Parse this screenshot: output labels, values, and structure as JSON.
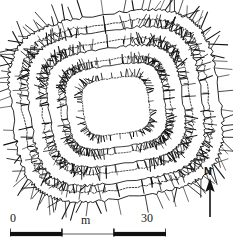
{
  "figure": {
    "kind": "archaeological-site-plan",
    "technique": "hachure",
    "ink_color": "#111111"
  },
  "scale_bar": {
    "name": "scale-bar",
    "start_label": "0",
    "unit_label": "m",
    "end_label": "30",
    "segments": [
      {
        "fill": "#101010",
        "from": 0,
        "to": 33.3
      },
      {
        "fill": "#9a9a9a",
        "from": 33.3,
        "to": 66.6
      },
      {
        "fill": "#101010",
        "from": 66.6,
        "to": 100
      }
    ],
    "tick_color": "#101010"
  },
  "north_arrow": {
    "name": "north-arrow",
    "label": "N",
    "direction": "up",
    "color": "#111111"
  },
  "plan": {
    "ring_count": 4,
    "rings": [
      {
        "name": "outer-rampart",
        "hachure_side": "outward",
        "stroke": "#111111"
      },
      {
        "name": "middle-rampart",
        "hachure_side": "outward",
        "stroke": "#111111"
      },
      {
        "name": "inner-rampart",
        "hachure_side": "outward",
        "stroke": "#111111"
      },
      {
        "name": "central-enclosure",
        "hachure_side": "outward",
        "stroke": "#111111"
      }
    ],
    "rotation_degrees": -8
  }
}
